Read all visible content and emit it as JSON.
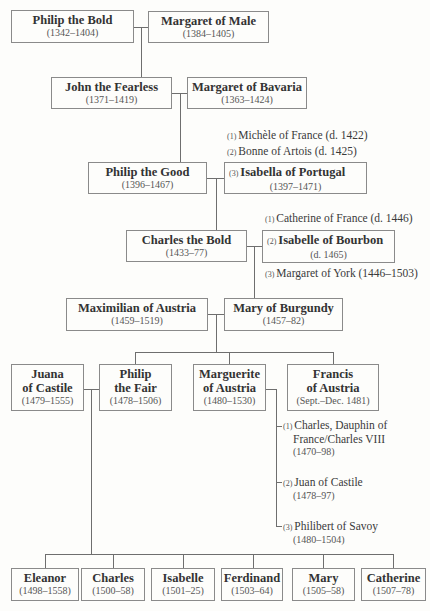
{
  "generations": {
    "g1": {
      "husband": {
        "name": "Philip the Bold",
        "dates": "(1342–1404)"
      },
      "wife": {
        "name": "Margaret of Male",
        "dates": "(1384–1405)"
      }
    },
    "g2": {
      "husband": {
        "name": "John the Fearless",
        "dates": "(1371–1419)"
      },
      "wife": {
        "name": "Margaret of Bavaria",
        "dates": "(1363–1424)"
      }
    },
    "g3": {
      "husband": {
        "name": "Philip the Good",
        "dates": "(1396–1467)"
      },
      "other_wives": [
        {
          "order": "(1)",
          "text": "Michèle of France (d. 1422)"
        },
        {
          "order": "(2)",
          "text": "Bonne of Artois (d. 1425)"
        }
      ],
      "wife": {
        "order": "(3)",
        "name": "Isabella of Portugal",
        "dates": "(1397–1471)"
      }
    },
    "g4": {
      "husband": {
        "name": "Charles the Bold",
        "dates": "(1433–77)"
      },
      "other_wives": [
        {
          "order": "(1)",
          "text": "Catherine of France (d. 1446)"
        },
        {
          "order": "(3)",
          "text": "Margaret of York (1446–1503)"
        }
      ],
      "wife": {
        "order": "(2)",
        "name": "Isabelle of Bourbon",
        "dates": "(d. 1465)"
      }
    },
    "g5": {
      "husband": {
        "name": "Maximilian of Austria",
        "dates": "(1459–1519)"
      },
      "wife": {
        "name": "Mary of Burgundy",
        "dates": "(1457–82)"
      }
    },
    "g6": {
      "juana": {
        "name_line1": "Juana",
        "name_line2": "of Castile",
        "dates": "(1479–1555)"
      },
      "children": [
        {
          "name_line1": "Philip",
          "name_line2": "the Fair",
          "dates": "(1478–1506)"
        },
        {
          "name_line1": "Marguerite",
          "name_line2": "of Austria",
          "dates": "(1480–1530)"
        },
        {
          "name_line1": "Francis",
          "name_line2": "of Austria",
          "dates": "(Sept.–Dec. 1481)"
        }
      ],
      "marguerite_spouses": [
        {
          "order": "(1)",
          "line1": "Charles, Dauphin of",
          "line2": "France/Charles VIII",
          "dates": "(1470–98)"
        },
        {
          "order": "(2)",
          "line1": "Juan of Castile",
          "dates": "(1478–97)"
        },
        {
          "order": "(3)",
          "line1": "Philibert of Savoy",
          "dates": "(1480–1504)"
        }
      ]
    },
    "g7": {
      "children": [
        {
          "name": "Eleanor",
          "dates": "(1498–1558)"
        },
        {
          "name": "Charles",
          "dates": "(1500–58)"
        },
        {
          "name": "Isabelle",
          "dates": "(1501–25)"
        },
        {
          "name": "Ferdinand",
          "dates": "(1503–64)"
        },
        {
          "name": "Mary",
          "dates": "(1505–58)"
        },
        {
          "name": "Catherine",
          "dates": "(1507–78)"
        }
      ]
    }
  }
}
